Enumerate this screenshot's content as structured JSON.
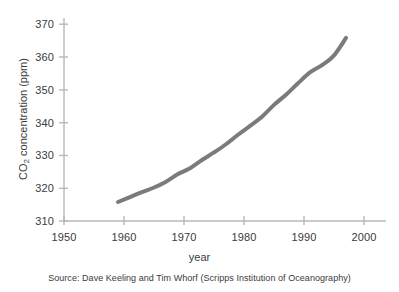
{
  "figure": {
    "background_color": "#ffffff",
    "axis_color": "#b8b8b8",
    "text_color": "#3b3b3b"
  },
  "axis_titles": {
    "y_prefix": "CO",
    "y_subscript": "2",
    "y_suffix": " concentration (ppm)",
    "y_full": "CO2 concentration (ppm)",
    "x": "year"
  },
  "caption": {
    "source": "Source: Dave Keeling and Tim Whorf (Scripps Institution of Oceanography)"
  },
  "chart_data": {
    "type": "line",
    "title": "",
    "subtitle": "",
    "xlabel": "year",
    "ylabel": "CO2 concentration (ppm)",
    "xlim": [
      1950,
      2001
    ],
    "ylim": [
      310,
      372
    ],
    "xticks": [
      1950,
      1960,
      1970,
      1980,
      1990,
      2000
    ],
    "xtick_labels": [
      "1950",
      "1960",
      "1970",
      "1980",
      "1990",
      "2000"
    ],
    "yticks": [
      310,
      320,
      330,
      340,
      350,
      360,
      370
    ],
    "ytick_labels": [
      "310",
      "320",
      "330",
      "340",
      "350",
      "360",
      "370"
    ],
    "grid": false,
    "legend": null,
    "series": [
      {
        "name": "Mauna Loa CO2 concentration",
        "color": "#7b7b7b",
        "line_width": 4,
        "x": [
          1959,
          1961,
          1963,
          1965,
          1967,
          1969,
          1971,
          1973,
          1975,
          1977,
          1979,
          1981,
          1983,
          1985,
          1987,
          1989,
          1991,
          1993,
          1995,
          1997
        ],
        "values": [
          315.8,
          317.3,
          318.8,
          320.2,
          322.0,
          324.3,
          326.1,
          328.6,
          330.9,
          333.4,
          336.3,
          339.0,
          341.8,
          345.4,
          348.5,
          352.0,
          355.3,
          357.5,
          360.5,
          365.8
        ]
      }
    ]
  }
}
